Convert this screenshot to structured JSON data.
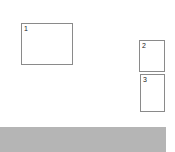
{
  "frames": [
    {
      "label": "1",
      "x": 21,
      "y": 23,
      "w": 52,
      "h": 42
    },
    {
      "label": "2",
      "x": 139,
      "y": 40,
      "w": 26,
      "h": 32
    },
    {
      "label": "3",
      "x": 140,
      "y": 74,
      "w": 25,
      "h": 38
    }
  ],
  "bar": {
    "color": "#b5b5b5"
  }
}
